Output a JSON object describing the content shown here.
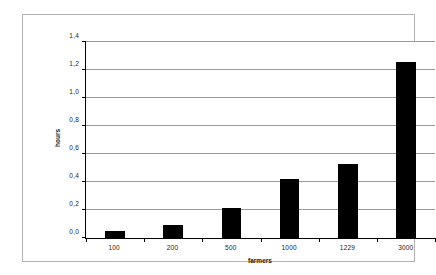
{
  "chart_data": {
    "type": "bar",
    "title": "",
    "subtitle": "",
    "xlabel": "farmers",
    "ylabel": "hours",
    "categories": [
      "100",
      "200",
      "500",
      "1000",
      "1229",
      "3000"
    ],
    "values": [
      0.05,
      0.09,
      0.215,
      0.425,
      0.53,
      1.26
    ],
    "series": [
      {
        "name": "hours",
        "values": [
          0.05,
          0.09,
          0.215,
          0.425,
          0.53,
          1.26
        ]
      }
    ],
    "ylim": [
      0.0,
      1.4
    ],
    "ytick_values": [
      0.0,
      0.2,
      0.4,
      0.6,
      0.8,
      1.0,
      1.2,
      1.4
    ],
    "ytick_labels": [
      "0,0",
      "0,2",
      "0,4",
      "0,6",
      "0,8",
      "1,0",
      "1,2",
      "1,4"
    ],
    "grid": true,
    "grid_axis": "y",
    "legend": false,
    "legend_position": "none",
    "bar_color": "#000000",
    "gridline_color": "#9a9a9a",
    "axis_color": "#000000",
    "frame_color": "#b4b4b4",
    "background_color": "#ffffff",
    "decimal_separator": ","
  }
}
